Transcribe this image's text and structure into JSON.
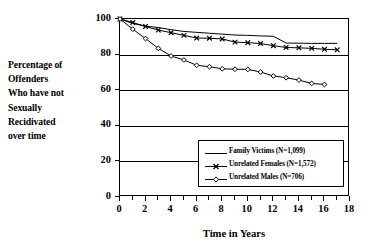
{
  "ylabel_lines": [
    "Percentage of",
    "Offenders",
    "Who have not",
    "Sexually",
    "Recidivated",
    "over time"
  ],
  "axis": {
    "xtitle": "Time in Years",
    "ytick_labels": [
      "0",
      "20",
      "40",
      "60",
      "80",
      "100"
    ],
    "xtick_labels": [
      "0",
      "2",
      "4",
      "6",
      "8",
      "10",
      "12",
      "14",
      "16",
      "18"
    ]
  },
  "legend": {
    "items": [
      {
        "label": "Family Victims  (N=1,099)",
        "marker": "none",
        "color": "#000000"
      },
      {
        "label": "Unrelated Females  (N=1,572)",
        "marker": "cross",
        "color": "#000000"
      },
      {
        "label": "Unrelated Males  (N=706)",
        "marker": "diamond",
        "color": "#000000"
      }
    ]
  },
  "chart_data": {
    "type": "line",
    "title": "",
    "xlabel": "Time in Years",
    "ylabel": "Percentage of Offenders Who have not Sexually Recidivated over time",
    "xlim": [
      0,
      18
    ],
    "ylim": [
      0,
      100
    ],
    "xticks": [
      0,
      2,
      4,
      6,
      8,
      10,
      12,
      14,
      16,
      18
    ],
    "yticks": [
      0,
      20,
      40,
      60,
      80,
      100
    ],
    "grid": "horizontal",
    "legend_position": "lower-right-inside",
    "series": [
      {
        "name": "Family Victims (N=1,099)",
        "n": 1099,
        "marker": "none",
        "x": [
          0,
          1,
          2,
          3,
          4,
          5,
          6,
          7,
          8,
          9,
          10,
          11,
          12,
          13,
          14,
          15,
          16,
          17
        ],
        "values": [
          100,
          97.5,
          96,
          95.2,
          94,
          93,
          92.5,
          92,
          91.5,
          91,
          90.8,
          90.5,
          90.3,
          86.5,
          86.4,
          86.3,
          86.3,
          86.3
        ]
      },
      {
        "name": "Unrelated Females (N=1,572)",
        "n": 1572,
        "marker": "cross",
        "x": [
          0,
          1,
          2,
          3,
          4,
          5,
          6,
          7,
          8,
          9,
          10,
          11,
          12,
          13,
          14,
          15,
          16,
          17
        ],
        "values": [
          100,
          98,
          95.8,
          93.8,
          92.3,
          90.8,
          89.3,
          89.2,
          88.8,
          87,
          86.7,
          86.2,
          85,
          84,
          83.8,
          83.5,
          83,
          82.7
        ]
      },
      {
        "name": "Unrelated Males (N=706)",
        "n": 706,
        "marker": "diamond",
        "x": [
          0,
          1,
          2,
          3,
          4,
          5,
          6,
          7,
          8,
          9,
          10,
          11,
          12,
          13,
          14,
          15,
          16
        ],
        "values": [
          100,
          94.3,
          89,
          83.5,
          79.2,
          77,
          74,
          73.2,
          72,
          71.8,
          71.7,
          70.2,
          68,
          67,
          65.7,
          63.8,
          63.2
        ]
      }
    ]
  }
}
